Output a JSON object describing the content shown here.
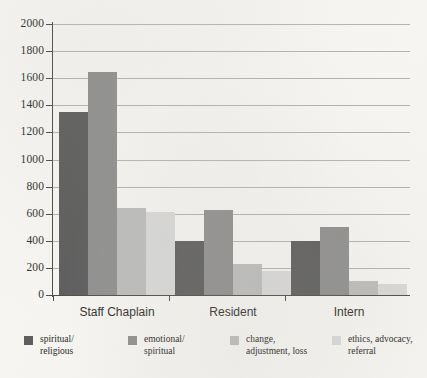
{
  "chart_data": {
    "type": "bar",
    "title": "",
    "xlabel": "",
    "ylabel": "",
    "ylim": [
      0,
      2000
    ],
    "ytick_step": 200,
    "yticks": [
      2000,
      1800,
      1600,
      1400,
      1200,
      1000,
      800,
      600,
      400,
      200,
      0
    ],
    "grid": true,
    "legend_position": "bottom",
    "categories": [
      "Staff Chaplain",
      "Resident",
      "Intern"
    ],
    "series": [
      {
        "name": "spiritual/\nreligious",
        "color": "#5b5b5b",
        "values": [
          1350,
          400,
          400
        ]
      },
      {
        "name": "emotional/\nspiritual",
        "color": "#8e8e8e",
        "values": [
          1645,
          630,
          500
        ]
      },
      {
        "name": "change,\nadjustment, loss",
        "color": "#bcbcbc",
        "values": [
          645,
          230,
          105
        ]
      },
      {
        "name": "ethics, advocacy,\nreferral",
        "color": "#d9d9d9",
        "values": [
          610,
          180,
          80
        ]
      }
    ]
  },
  "axis": {
    "tick_labels": [
      "2000",
      "1800",
      "1600",
      "1400",
      "1200",
      "1000",
      "800",
      "600",
      "400",
      "200",
      "0"
    ]
  },
  "legend": {
    "items": [
      {
        "label": "spiritual/\nreligious",
        "color": "#5b5b5b"
      },
      {
        "label": "emotional/\nspiritual",
        "color": "#8e8e8e"
      },
      {
        "label": "change,\nadjustment, loss",
        "color": "#bcbcbc"
      },
      {
        "label": "ethics, advocacy,\nreferral",
        "color": "#d9d9d9"
      }
    ]
  },
  "colors": {
    "background": "#f7f6f3",
    "axis": "#4a4a48",
    "gridline": "#9d9d99",
    "text": "#2b2b29"
  }
}
